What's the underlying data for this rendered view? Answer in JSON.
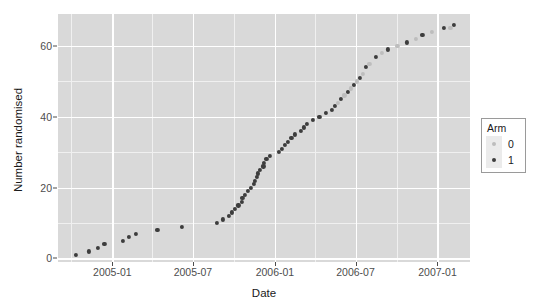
{
  "chart_data": {
    "type": "scatter",
    "title": "",
    "xlabel": "Date",
    "ylabel": "Number randomised",
    "xlim": [
      "2004-09-01",
      "2007-03-15"
    ],
    "ylim": [
      -1,
      69
    ],
    "grid": true,
    "legend": {
      "position": "right",
      "title": "Arm",
      "entries": [
        {
          "label": "0",
          "color": "#bdbdbd"
        },
        {
          "label": "1",
          "color": "#3d3d3d"
        }
      ]
    },
    "x_ticks": [
      {
        "label": "2005-01",
        "value": "2005-01-01"
      },
      {
        "label": "2005-07",
        "value": "2005-07-01"
      },
      {
        "label": "2006-01",
        "value": "2006-01-01"
      },
      {
        "label": "2006-07",
        "value": "2006-07-01"
      },
      {
        "label": "2007-01",
        "value": "2007-01-01"
      }
    ],
    "y_ticks": [
      {
        "label": "0",
        "value": 0
      },
      {
        "label": "20",
        "value": 20
      },
      {
        "label": "40",
        "value": 40
      },
      {
        "label": "60",
        "value": 60
      }
    ],
    "y_minor_ticks": [
      10,
      30,
      50
    ],
    "x_minor_ticks": [
      "2004-10-01",
      "2005-04-01",
      "2005-10-01",
      "2006-04-01",
      "2006-10-01"
    ],
    "series": [
      {
        "name": "1",
        "color": "#3d3d3d",
        "points": [
          {
            "x": "2004-10-12",
            "y": 1
          },
          {
            "x": "2004-11-09",
            "y": 2
          },
          {
            "x": "2004-11-30",
            "y": 3
          },
          {
            "x": "2004-12-14",
            "y": 4
          },
          {
            "x": "2005-01-25",
            "y": 5
          },
          {
            "x": "2005-02-08",
            "y": 6
          },
          {
            "x": "2005-02-22",
            "y": 7
          },
          {
            "x": "2005-04-12",
            "y": 8
          },
          {
            "x": "2005-06-07",
            "y": 9
          },
          {
            "x": "2005-08-23",
            "y": 10
          },
          {
            "x": "2005-09-06",
            "y": 11
          },
          {
            "x": "2005-09-20",
            "y": 12
          },
          {
            "x": "2005-09-27",
            "y": 13
          },
          {
            "x": "2005-10-04",
            "y": 14
          },
          {
            "x": "2005-10-11",
            "y": 15
          },
          {
            "x": "2005-10-18",
            "y": 16
          },
          {
            "x": "2005-10-20",
            "y": 17
          },
          {
            "x": "2005-10-25",
            "y": 18
          },
          {
            "x": "2005-11-01",
            "y": 19
          },
          {
            "x": "2005-11-08",
            "y": 20
          },
          {
            "x": "2005-11-15",
            "y": 21
          },
          {
            "x": "2005-11-17",
            "y": 22
          },
          {
            "x": "2005-11-22",
            "y": 23
          },
          {
            "x": "2005-11-24",
            "y": 24
          },
          {
            "x": "2005-11-29",
            "y": 25
          },
          {
            "x": "2005-12-06",
            "y": 26
          },
          {
            "x": "2005-12-08",
            "y": 27
          },
          {
            "x": "2005-12-13",
            "y": 28
          },
          {
            "x": "2005-12-20",
            "y": 29
          },
          {
            "x": "2006-01-10",
            "y": 30
          },
          {
            "x": "2006-01-17",
            "y": 31
          },
          {
            "x": "2006-01-24",
            "y": 32
          },
          {
            "x": "2006-01-31",
            "y": 33
          },
          {
            "x": "2006-02-07",
            "y": 34
          },
          {
            "x": "2006-02-14",
            "y": 35
          },
          {
            "x": "2006-02-28",
            "y": 36
          },
          {
            "x": "2006-03-07",
            "y": 37
          },
          {
            "x": "2006-03-14",
            "y": 38
          },
          {
            "x": "2006-03-28",
            "y": 39
          },
          {
            "x": "2006-04-11",
            "y": 40
          },
          {
            "x": "2006-04-25",
            "y": 41
          },
          {
            "x": "2006-05-09",
            "y": 42
          },
          {
            "x": "2006-05-16",
            "y": 43
          },
          {
            "x": "2006-05-30",
            "y": 45
          },
          {
            "x": "2006-06-13",
            "y": 47
          },
          {
            "x": "2006-06-27",
            "y": 49
          },
          {
            "x": "2006-07-11",
            "y": 51
          },
          {
            "x": "2006-07-25",
            "y": 54
          },
          {
            "x": "2006-08-15",
            "y": 57
          },
          {
            "x": "2006-09-12",
            "y": 59
          },
          {
            "x": "2006-10-24",
            "y": 61
          },
          {
            "x": "2006-11-28",
            "y": 63
          },
          {
            "x": "2007-01-16",
            "y": 65
          },
          {
            "x": "2007-02-06",
            "y": 66
          }
        ]
      },
      {
        "name": "0",
        "color": "#bdbdbd",
        "points": [
          {
            "x": "2006-05-23",
            "y": 44
          },
          {
            "x": "2006-06-06",
            "y": 46
          },
          {
            "x": "2006-06-20",
            "y": 48
          },
          {
            "x": "2006-07-04",
            "y": 50
          },
          {
            "x": "2006-07-18",
            "y": 52
          },
          {
            "x": "2006-08-01",
            "y": 55
          },
          {
            "x": "2006-08-29",
            "y": 58
          },
          {
            "x": "2006-10-03",
            "y": 60
          },
          {
            "x": "2006-11-14",
            "y": 62
          },
          {
            "x": "2006-12-19",
            "y": 64
          },
          {
            "x": "2007-01-30",
            "y": 65
          }
        ]
      }
    ]
  }
}
